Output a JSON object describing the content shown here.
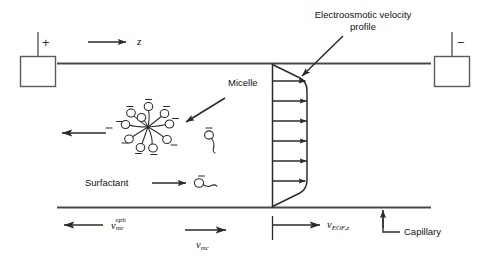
{
  "diagram": {
    "title_hidden": "",
    "type": "schematic"
  },
  "labels": {
    "eof_profile": "Electroosmotic velocity\nprofile",
    "eof_profile_line1": "Electroosmotic velocity",
    "eof_profile_line2": "profile",
    "micelle": "Micelle",
    "surfactant": "Surfactant",
    "capillary": "Capillary"
  },
  "axis": {
    "z_label": "z"
  },
  "electrodes": {
    "left": {
      "polarity": "+",
      "name": "anode"
    },
    "right": {
      "polarity": "−",
      "name": "cathode"
    }
  },
  "velocities": [
    {
      "id": "v-mc-eph",
      "symbol": "v",
      "superscript": "eph",
      "subscript": "mc",
      "direction": "left",
      "plain": "v_mc^eph"
    },
    {
      "id": "v-mc",
      "symbol": "v",
      "superscript": "",
      "subscript": "mc",
      "direction": "right",
      "plain": "v_mc"
    },
    {
      "id": "v-eof-z",
      "symbol": "v",
      "superscript": "",
      "subscript": "EOF,z",
      "direction": "right",
      "plain": "v_EOF,z"
    }
  ],
  "micelle": {
    "head_count": 10,
    "head_charge": "−",
    "center_label": ""
  },
  "free_surfactant": {
    "count": 1,
    "head_charge": "−"
  },
  "surfactant_key": {
    "head_charge": "−"
  },
  "flow_profile": {
    "shape": "plug",
    "arrow_count": 7,
    "direction": "right"
  },
  "colors": {
    "line": "#3a3a3a",
    "wall": "#555555",
    "text": "#111111",
    "background": "#ffffff"
  }
}
